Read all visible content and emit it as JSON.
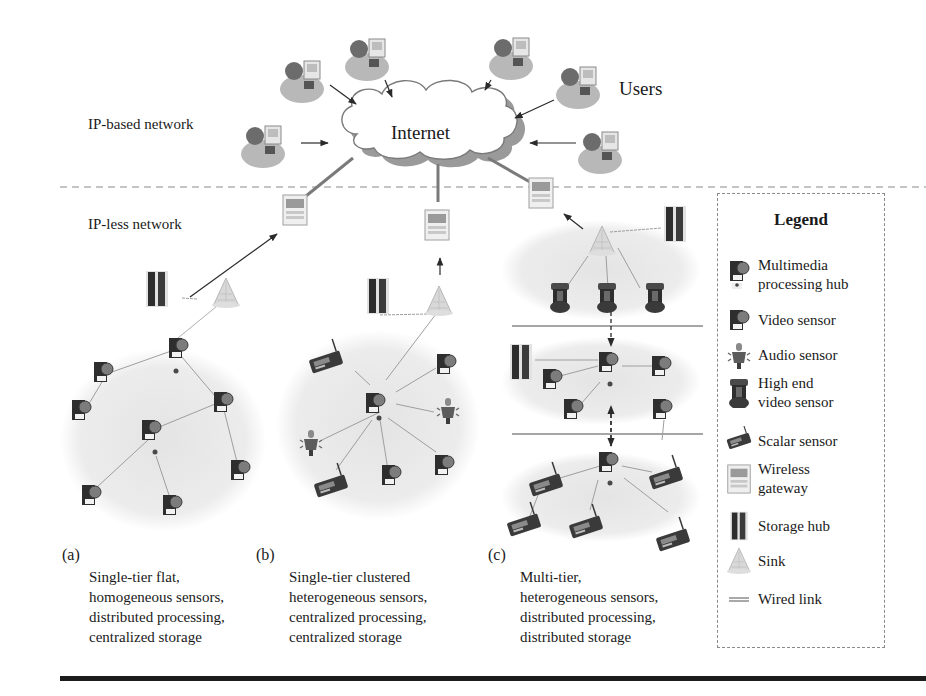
{
  "figure": {
    "zones": {
      "upper": "IP-based network",
      "lower": "IP-less network"
    },
    "cloud_label": "Internet",
    "users_label": "Users",
    "user_count": 6,
    "gateway_count": 3
  },
  "architectures": [
    {
      "letter": "(a)",
      "caption": "Single-tier flat,\nhomogeneous sensors,\ndistributed processing,\ncentralized storage",
      "nodes": [
        "wireless-gateway",
        "sink",
        "storage-hub",
        "video-sensor x8",
        "multimedia-processing-hub x2"
      ]
    },
    {
      "letter": "(b)",
      "caption": "Single-tier clustered\nheterogeneous sensors,\ncentralized processing,\ncentralized storage",
      "nodes": [
        "wireless-gateway",
        "sink",
        "storage-hub",
        "multimedia-processing-hub",
        "video-sensor x3",
        "audio-sensor x2",
        "scalar-sensor x2"
      ]
    },
    {
      "letter": "(c)",
      "caption": "Multi-tier,\nheterogeneous sensors,\ndistributed processing,\ndistributed storage",
      "tiers": [
        {
          "tier": 3,
          "nodes": [
            "sink",
            "storage-hub",
            "high-end-video-sensor x3"
          ]
        },
        {
          "tier": 2,
          "nodes": [
            "multimedia-processing-hub",
            "storage-hub",
            "video-sensor x4"
          ]
        },
        {
          "tier": 1,
          "nodes": [
            "multimedia-processing-hub",
            "scalar-sensor x5"
          ]
        }
      ]
    }
  ],
  "legend": {
    "title": "Legend",
    "items": [
      {
        "icon": "multimedia-hub-icon",
        "label": "Multimedia\nprocessing hub"
      },
      {
        "icon": "video-sensor-icon",
        "label": "Video sensor"
      },
      {
        "icon": "audio-sensor-icon",
        "label": "Audio sensor"
      },
      {
        "icon": "high-end-video-sensor-icon",
        "label": "High end\nvideo sensor"
      },
      {
        "icon": "scalar-sensor-icon",
        "label": "Scalar sensor"
      },
      {
        "icon": "wireless-gateway-icon",
        "label": "Wireless\ngateway"
      },
      {
        "icon": "storage-hub-icon",
        "label": "Storage hub"
      },
      {
        "icon": "sink-icon",
        "label": "Sink"
      },
      {
        "icon": "wired-link-icon",
        "label": "Wired link"
      }
    ]
  },
  "colors": {
    "ink": "#1a1a1a",
    "cluster_fill": "#ececec",
    "cloud_shadow": "#9a9a9a",
    "dashed_divider": "#8c8c8c",
    "link_gray": "#9e9e9e",
    "wired_link": "#7a7a7a"
  }
}
